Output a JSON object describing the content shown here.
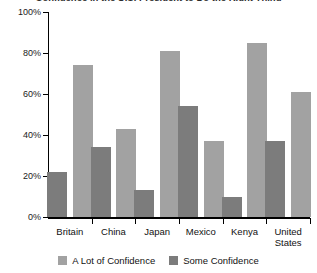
{
  "chart_data": {
    "type": "bar",
    "title": "Confidence in the U.S. President to Do the Right Thing",
    "xlabel": "",
    "ylabel": "",
    "ylim": [
      0,
      100
    ],
    "ytick_labels": [
      "0%",
      "20%",
      "40%",
      "60%",
      "80%",
      "100%"
    ],
    "ytick_values": [
      0,
      20,
      40,
      60,
      80,
      100
    ],
    "grid": false,
    "legend_position": "bottom",
    "categories": [
      "Britain",
      "China",
      "Japan",
      "Mexico",
      "Kenya",
      "United States"
    ],
    "series": [
      {
        "name": "A Lot of Confidence",
        "color": "#a2a2a2",
        "values": [
          74,
          43,
          81,
          37,
          85,
          61
        ]
      },
      {
        "name": "Some Confidence",
        "color": "#7c7c7c",
        "values": [
          22,
          34,
          13,
          54,
          10,
          37
        ]
      }
    ],
    "draw_order": [
      "Some Confidence",
      "A Lot of Confidence"
    ]
  },
  "legend": {
    "items": [
      {
        "label": "A Lot of Confidence",
        "color": "#a2a2a2"
      },
      {
        "label": "Some Confidence",
        "color": "#7c7c7c"
      }
    ]
  },
  "axis": {
    "y_labels": [
      "100%",
      "80%",
      "60%",
      "40%",
      "20%",
      "0%"
    ]
  }
}
